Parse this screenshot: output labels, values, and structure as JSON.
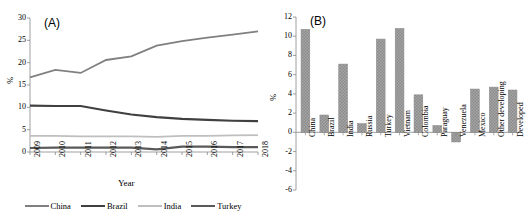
{
  "figure": {
    "panel_a_tag": "(A)",
    "panel_b_tag": "(B)"
  },
  "chart_data": [
    {
      "type": "line",
      "title": "(A)",
      "xlabel": "Year",
      "ylabel": "%",
      "ylim": [
        0,
        30
      ],
      "yticks": [
        0,
        5,
        10,
        15,
        20,
        25,
        30
      ],
      "grid": false,
      "legend_position": "bottom",
      "categories": [
        "2009",
        "2010",
        "2011",
        "2012",
        "2013",
        "2014",
        "2015",
        "2016",
        "2017",
        "2018"
      ],
      "series": [
        {
          "name": "China",
          "color": "#808080",
          "values": [
            16.7,
            18.4,
            17.7,
            20.6,
            21.4,
            23.8,
            24.8,
            25.6,
            26.3,
            27.0
          ]
        },
        {
          "name": "Brazil",
          "color": "#404040",
          "values": [
            10.4,
            10.3,
            10.3,
            9.3,
            8.4,
            7.8,
            7.4,
            7.2,
            7.0,
            6.9
          ]
        },
        {
          "name": "India",
          "color": "#bfbfbf",
          "values": [
            3.6,
            3.6,
            3.5,
            3.5,
            3.5,
            3.4,
            3.6,
            3.6,
            3.7,
            3.8
          ]
        },
        {
          "name": "Turkey",
          "color": "#595959",
          "values": [
            0.9,
            1.0,
            1.0,
            1.0,
            1.0,
            0.6,
            1.2,
            1.2,
            1.1,
            1.1
          ]
        }
      ]
    },
    {
      "type": "bar",
      "title": "(B)",
      "xlabel": "",
      "ylabel": "%",
      "ylim": [
        -6,
        12
      ],
      "yticks": [
        -6,
        -4,
        -2,
        0,
        2,
        4,
        6,
        8,
        10,
        12
      ],
      "grid": false,
      "bar_color": "#9a9a9a",
      "categories": [
        "China",
        "Brazil",
        "India",
        "Russia",
        "Turkey",
        "Vietnam",
        "Colombia",
        "Paraguay",
        "Venezuela",
        "Mexico",
        "Other developing",
        "Developed"
      ],
      "values": [
        10.7,
        1.8,
        7.1,
        0.9,
        9.7,
        10.8,
        3.9,
        0.7,
        -1.0,
        4.5,
        4.7,
        4.4
      ]
    }
  ]
}
